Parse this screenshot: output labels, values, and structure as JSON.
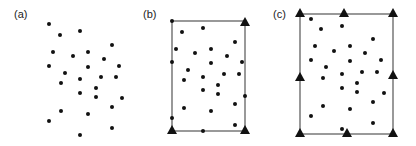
{
  "colors": {
    "point": "#111111",
    "frame": "#555555",
    "background": "#ffffff",
    "label": "#222222"
  },
  "panels": [
    {
      "label": "(a)",
      "label_pos": [
        14,
        18
      ],
      "frame": null,
      "points": [
        [
          49,
          24
        ],
        [
          60,
          35
        ],
        [
          80,
          31
        ],
        [
          112,
          45
        ],
        [
          53,
          52
        ],
        [
          73,
          56
        ],
        [
          88,
          52
        ],
        [
          104,
          59
        ],
        [
          49,
          66
        ],
        [
          65,
          73
        ],
        [
          88,
          67
        ],
        [
          119,
          66
        ],
        [
          61,
          83
        ],
        [
          80,
          79
        ],
        [
          101,
          77
        ],
        [
          116,
          77
        ],
        [
          96,
          88
        ],
        [
          80,
          93
        ],
        [
          96,
          97
        ],
        [
          122,
          98
        ],
        [
          112,
          107
        ],
        [
          61,
          111
        ],
        [
          88,
          114
        ],
        [
          49,
          121
        ],
        [
          112,
          128
        ],
        [
          80,
          135
        ]
      ],
      "triangles": []
    },
    {
      "label": "(b)",
      "label_pos": [
        143,
        18
      ],
      "frame": {
        "x1": 172,
        "y1": 21,
        "x2": 245,
        "y2": 131
      },
      "points": [
        [
          172,
          21
        ],
        [
          182,
          32
        ],
        [
          203,
          28
        ],
        [
          235,
          42
        ],
        [
          176,
          49
        ],
        [
          195,
          53
        ],
        [
          211,
          49
        ],
        [
          227,
          56
        ],
        [
          172,
          62
        ],
        [
          211,
          63
        ],
        [
          242,
          62
        ],
        [
          188,
          70
        ],
        [
          184,
          80
        ],
        [
          203,
          77
        ],
        [
          224,
          74
        ],
        [
          239,
          74
        ],
        [
          218,
          85
        ],
        [
          203,
          90
        ],
        [
          218,
          94
        ],
        [
          245,
          96
        ],
        [
          235,
          104
        ],
        [
          184,
          108
        ],
        [
          211,
          111
        ],
        [
          172,
          118
        ],
        [
          235,
          125
        ],
        [
          203,
          131
        ]
      ],
      "triangles": [
        [
          245,
          22
        ],
        [
          172,
          130
        ],
        [
          245,
          130
        ]
      ]
    },
    {
      "label": "(c)",
      "label_pos": [
        273,
        18
      ],
      "frame": {
        "x1": 300,
        "y1": 14,
        "x2": 393,
        "y2": 134
      },
      "points": [
        [
          311,
          19
        ],
        [
          321,
          29
        ],
        [
          342,
          26
        ],
        [
          373,
          39
        ],
        [
          315,
          46
        ],
        [
          334,
          51
        ],
        [
          350,
          46
        ],
        [
          365,
          53
        ],
        [
          311,
          60
        ],
        [
          350,
          61
        ],
        [
          381,
          60
        ],
        [
          326,
          67
        ],
        [
          342,
          74
        ],
        [
          362,
          72
        ],
        [
          377,
          72
        ],
        [
          323,
          78
        ],
        [
          357,
          83
        ],
        [
          342,
          88
        ],
        [
          357,
          92
        ],
        [
          384,
          93
        ],
        [
          373,
          102
        ],
        [
          323,
          106
        ],
        [
          350,
          109
        ],
        [
          311,
          116
        ],
        [
          373,
          123
        ],
        [
          342,
          129
        ]
      ],
      "triangles": [
        [
          300,
          13
        ],
        [
          344,
          13
        ],
        [
          393,
          13
        ],
        [
          300,
          77
        ],
        [
          393,
          75
        ],
        [
          300,
          133
        ],
        [
          347,
          133
        ],
        [
          393,
          133
        ]
      ]
    }
  ]
}
